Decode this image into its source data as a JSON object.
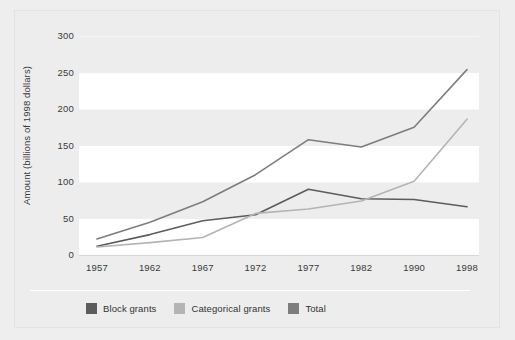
{
  "chart_data": {
    "type": "line",
    "title": "",
    "xlabel": "",
    "ylabel": "Amount (billions of 1998 dollars)",
    "x": [
      "1957",
      "1962",
      "1967",
      "1972",
      "1977",
      "1982",
      "1990",
      "1998"
    ],
    "categories": [
      "1957",
      "1962",
      "1967",
      "1972",
      "1977",
      "1982",
      "1990",
      "1998"
    ],
    "xtick_labels": [
      "1957",
      "1962",
      "1967",
      "1972",
      "1977",
      "1982",
      "1990",
      "1998"
    ],
    "ytick_labels": [
      "300",
      "250",
      "200",
      "150",
      "100",
      "50",
      "0"
    ],
    "ytick_values": [
      300,
      250,
      200,
      150,
      100,
      50,
      0
    ],
    "ylim": [
      0,
      300
    ],
    "grid": true,
    "legend_position": "bottom-left",
    "series": [
      {
        "name": "Block grants",
        "color": "#5c5c5c",
        "values": [
          12,
          28,
          47,
          55,
          90,
          77,
          76,
          66
        ]
      },
      {
        "name": "Categorical grants",
        "color": "#b4b4b4",
        "values": [
          11,
          17,
          24,
          57,
          63,
          74,
          101,
          186
        ]
      },
      {
        "name": "Total",
        "color": "#7d7d7d",
        "values": [
          22,
          45,
          73,
          110,
          158,
          148,
          175,
          254
        ]
      }
    ]
  },
  "legend": {
    "items": [
      {
        "label": "Block grants",
        "color": "#5c5c5c",
        "swatch": "legend-swatch-block-grants"
      },
      {
        "label": "Categorical grants",
        "color": "#b4b4b4",
        "swatch": "legend-swatch-categorical-grants"
      },
      {
        "label": "Total",
        "color": "#7d7d7d",
        "swatch": "legend-swatch-total"
      }
    ]
  },
  "colors": {
    "background": "#ededed",
    "plot_band": "#ffffff",
    "frame_border": "#e3e3e3",
    "axis_text": "#3a3a3a",
    "block_grants": "#5c5c5c",
    "categorical_grants": "#b4b4b4",
    "total": "#7d7d7d"
  }
}
